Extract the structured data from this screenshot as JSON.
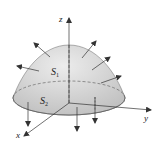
{
  "figure": {
    "type": "3d-surface-diagram",
    "labels": {
      "z_axis": "z",
      "y_axis": "y",
      "x_axis": "x",
      "surface_top": "S",
      "surface_top_sub": "1",
      "surface_bottom": "S",
      "surface_bottom_sub": "2"
    },
    "colors": {
      "surface_fill": "#c8c8c8",
      "surface_light": "#e6e6e6",
      "base_fill": "#b9b9b9",
      "line": "#333333",
      "background": "#ffffff"
    }
  }
}
